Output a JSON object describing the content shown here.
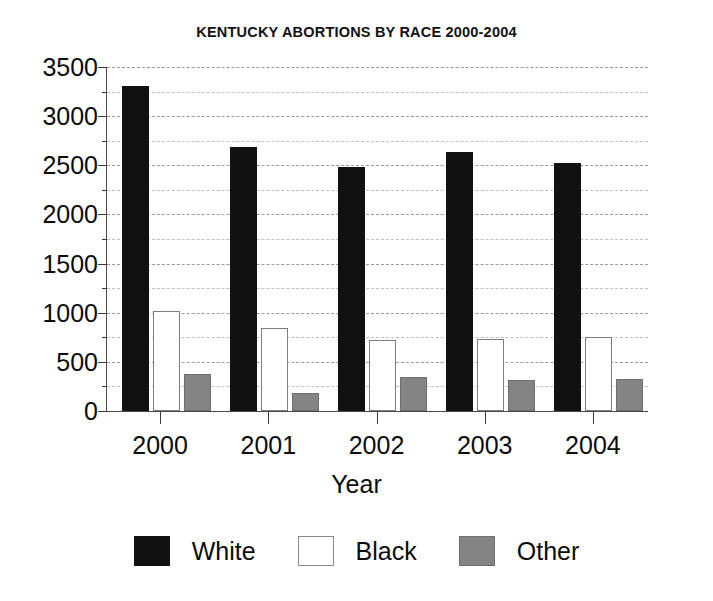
{
  "chart_data": {
    "type": "bar",
    "title": "KENTUCKY ABORTIONS BY RACE 2000-2004",
    "xlabel": "Year",
    "ylabel": "",
    "categories": [
      "2000",
      "2001",
      "2002",
      "2003",
      "2004"
    ],
    "series": [
      {
        "name": "White",
        "color": "#111111",
        "values": [
          3290,
          2670,
          2465,
          2610,
          2500
        ]
      },
      {
        "name": "Black",
        "color": "#ffffff",
        "values": [
          1000,
          820,
          700,
          710,
          730
        ]
      },
      {
        "name": "Other",
        "color": "#848484",
        "values": [
          360,
          165,
          325,
          295,
          310
        ]
      }
    ],
    "ylim": [
      0,
      3500
    ],
    "ytick_values": [
      0,
      500,
      1000,
      1500,
      2000,
      2500,
      3000,
      3500
    ],
    "ytick_labels": [
      "0",
      "500",
      "1000",
      "1500",
      "2000",
      "2500",
      "3000",
      "3500"
    ],
    "yminor_tick_values": [
      250,
      750,
      1250,
      1750,
      2250,
      2750,
      3250
    ],
    "grid": true,
    "grid_style": "dashed-horizontal",
    "legend_position": "bottom-center",
    "legend_entries": [
      "White",
      "Black",
      "Other"
    ],
    "annotations": []
  },
  "legend": {
    "items": [
      {
        "label": "White",
        "swatch": "filled-black-square"
      },
      {
        "label": "Black",
        "swatch": "empty-white-square"
      },
      {
        "label": "Other",
        "swatch": "filled-gray-square"
      }
    ]
  },
  "colors": {
    "white_series": "#111111",
    "black_series": "#ffffff",
    "other_series": "#848484",
    "axis": "#3a3a3a",
    "gridline": "#9a9a9a",
    "background": "#ffffff",
    "text": "#0b0b0b"
  }
}
